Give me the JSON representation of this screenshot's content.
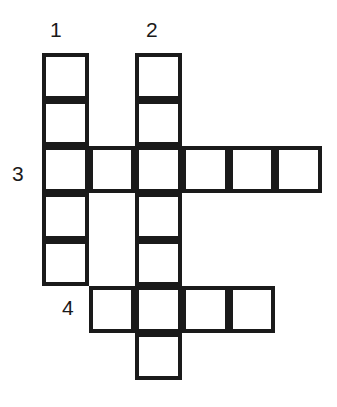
{
  "puzzle": {
    "type": "crossword-grid",
    "background_color": "#ffffff",
    "line_color": "#1a1a1a",
    "line_width_px": 4,
    "cell_size_px": 46.7,
    "origin": {
      "x": 42,
      "y": 53
    },
    "columns": 6,
    "rows": 7,
    "clue_numbers": [
      {
        "id": "1",
        "label": "1",
        "x": 50,
        "y": 19,
        "direction": "down",
        "entry_cell": {
          "col": 1,
          "row": 1
        },
        "length": 5
      },
      {
        "id": "2",
        "label": "2",
        "x": 146,
        "y": 19,
        "direction": "down",
        "entry_cell": {
          "col": 3,
          "row": 1
        },
        "length": 7
      },
      {
        "id": "3",
        "label": "3",
        "x": 12,
        "y": 163,
        "direction": "across",
        "entry_cell": {
          "col": 1,
          "row": 3
        },
        "length": 6
      },
      {
        "id": "4",
        "label": "4",
        "x": 62,
        "y": 297,
        "direction": "across",
        "entry_cell": {
          "col": 2,
          "row": 6
        },
        "length": 4
      }
    ],
    "cells": [
      {
        "name": "cell-c1r1",
        "col": 1,
        "row": 1,
        "x": 42,
        "y": 53,
        "w": 46.7,
        "h": 46.7
      },
      {
        "name": "cell-c1r2",
        "col": 1,
        "row": 2,
        "x": 42,
        "y": 99.7,
        "w": 46.7,
        "h": 46.7
      },
      {
        "name": "cell-c1r3",
        "col": 1,
        "row": 3,
        "x": 42,
        "y": 146.3,
        "w": 46.7,
        "h": 46.7
      },
      {
        "name": "cell-c1r4",
        "col": 1,
        "row": 4,
        "x": 42,
        "y": 193,
        "w": 46.7,
        "h": 46.7
      },
      {
        "name": "cell-c1r5",
        "col": 1,
        "row": 5,
        "x": 42,
        "y": 239.7,
        "w": 46.7,
        "h": 46.7
      },
      {
        "name": "cell-c2r3",
        "col": 2,
        "row": 3,
        "x": 88.7,
        "y": 146.3,
        "w": 46.7,
        "h": 46.7
      },
      {
        "name": "cell-c2r6",
        "col": 2,
        "row": 6,
        "x": 88.7,
        "y": 286.3,
        "w": 46.7,
        "h": 46.7
      },
      {
        "name": "cell-c3r1",
        "col": 3,
        "row": 1,
        "x": 135.3,
        "y": 53,
        "w": 46.7,
        "h": 46.7
      },
      {
        "name": "cell-c3r2",
        "col": 3,
        "row": 2,
        "x": 135.3,
        "y": 99.7,
        "w": 46.7,
        "h": 46.7
      },
      {
        "name": "cell-c3r3",
        "col": 3,
        "row": 3,
        "x": 135.3,
        "y": 146.3,
        "w": 46.7,
        "h": 46.7
      },
      {
        "name": "cell-c3r4",
        "col": 3,
        "row": 4,
        "x": 135.3,
        "y": 193,
        "w": 46.7,
        "h": 46.7
      },
      {
        "name": "cell-c3r5",
        "col": 3,
        "row": 5,
        "x": 135.3,
        "y": 239.7,
        "w": 46.7,
        "h": 46.7
      },
      {
        "name": "cell-c3r6",
        "col": 3,
        "row": 6,
        "x": 135.3,
        "y": 286.3,
        "w": 46.7,
        "h": 46.7
      },
      {
        "name": "cell-c3r7",
        "col": 3,
        "row": 7,
        "x": 135.3,
        "y": 333,
        "w": 46.7,
        "h": 46.7
      },
      {
        "name": "cell-c4r3",
        "col": 4,
        "row": 3,
        "x": 182,
        "y": 146.3,
        "w": 46.7,
        "h": 46.7
      },
      {
        "name": "cell-c4r6",
        "col": 4,
        "row": 6,
        "x": 182,
        "y": 286.3,
        "w": 46.7,
        "h": 46.7
      },
      {
        "name": "cell-c5r3",
        "col": 5,
        "row": 3,
        "x": 228.7,
        "y": 146.3,
        "w": 46.7,
        "h": 46.7
      },
      {
        "name": "cell-c5r6",
        "col": 5,
        "row": 6,
        "x": 228.7,
        "y": 286.3,
        "w": 46.7,
        "h": 46.7
      },
      {
        "name": "cell-c6r3",
        "col": 6,
        "row": 3,
        "x": 275.3,
        "y": 146.3,
        "w": 46.7,
        "h": 46.7
      }
    ]
  }
}
